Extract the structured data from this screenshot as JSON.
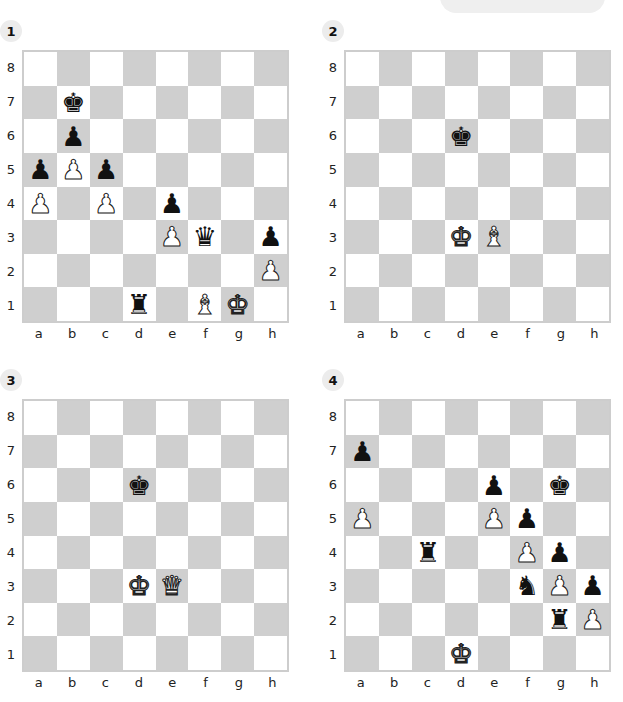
{
  "colors": {
    "light_square": "#ffffff",
    "dark_square": "#cfcfcf",
    "border": "#cdcdcd",
    "badge": "#ececec"
  },
  "ranks": [
    "8",
    "7",
    "6",
    "5",
    "4",
    "3",
    "2",
    "1"
  ],
  "files": [
    "a",
    "b",
    "c",
    "d",
    "e",
    "f",
    "g",
    "h"
  ],
  "diagrams": [
    {
      "number": "1",
      "pieces": [
        {
          "square": "b7",
          "color": "black",
          "type": "king"
        },
        {
          "square": "b6",
          "color": "black",
          "type": "pawn"
        },
        {
          "square": "a5",
          "color": "black",
          "type": "pawn"
        },
        {
          "square": "b5",
          "color": "white",
          "type": "pawn"
        },
        {
          "square": "c5",
          "color": "black",
          "type": "pawn"
        },
        {
          "square": "a4",
          "color": "white",
          "type": "pawn"
        },
        {
          "square": "c4",
          "color": "white",
          "type": "pawn"
        },
        {
          "square": "e4",
          "color": "black",
          "type": "pawn"
        },
        {
          "square": "e3",
          "color": "white",
          "type": "pawn"
        },
        {
          "square": "f3",
          "color": "black",
          "type": "queen"
        },
        {
          "square": "h3",
          "color": "black",
          "type": "pawn"
        },
        {
          "square": "h2",
          "color": "white",
          "type": "pawn"
        },
        {
          "square": "d1",
          "color": "black",
          "type": "rook"
        },
        {
          "square": "f1",
          "color": "white",
          "type": "bishop"
        },
        {
          "square": "g1",
          "color": "white",
          "type": "king"
        }
      ]
    },
    {
      "number": "2",
      "pieces": [
        {
          "square": "d6",
          "color": "black",
          "type": "king"
        },
        {
          "square": "d3",
          "color": "white",
          "type": "king"
        },
        {
          "square": "e3",
          "color": "white",
          "type": "bishop"
        }
      ]
    },
    {
      "number": "3",
      "pieces": [
        {
          "square": "d6",
          "color": "black",
          "type": "king"
        },
        {
          "square": "d3",
          "color": "white",
          "type": "king"
        },
        {
          "square": "e3",
          "color": "white",
          "type": "queen"
        }
      ]
    },
    {
      "number": "4",
      "pieces": [
        {
          "square": "a7",
          "color": "black",
          "type": "pawn"
        },
        {
          "square": "e6",
          "color": "black",
          "type": "pawn"
        },
        {
          "square": "g6",
          "color": "black",
          "type": "king"
        },
        {
          "square": "a5",
          "color": "white",
          "type": "pawn"
        },
        {
          "square": "e5",
          "color": "white",
          "type": "pawn"
        },
        {
          "square": "f5",
          "color": "black",
          "type": "pawn"
        },
        {
          "square": "c4",
          "color": "black",
          "type": "rook"
        },
        {
          "square": "f4",
          "color": "white",
          "type": "pawn"
        },
        {
          "square": "g4",
          "color": "black",
          "type": "pawn"
        },
        {
          "square": "f3",
          "color": "black",
          "type": "knight"
        },
        {
          "square": "g3",
          "color": "white",
          "type": "pawn"
        },
        {
          "square": "h3",
          "color": "black",
          "type": "pawn"
        },
        {
          "square": "g2",
          "color": "black",
          "type": "rook"
        },
        {
          "square": "h2",
          "color": "white",
          "type": "pawn"
        },
        {
          "square": "d1",
          "color": "white",
          "type": "king"
        }
      ]
    }
  ]
}
